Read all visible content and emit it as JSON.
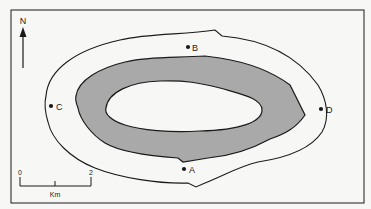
{
  "map": {
    "north_label": "N",
    "points": [
      {
        "id": "A",
        "label": "A"
      },
      {
        "id": "B",
        "label": "B"
      },
      {
        "id": "C",
        "label": "C"
      },
      {
        "id": "D",
        "label": "D"
      }
    ],
    "scale_bar": {
      "start_label": "0",
      "end_label": "2",
      "unit_label": "Km"
    },
    "colors": {
      "background": "#f7f7f5",
      "shaded_zone": "#a9a9a9",
      "line": "#1a1a1a"
    }
  }
}
